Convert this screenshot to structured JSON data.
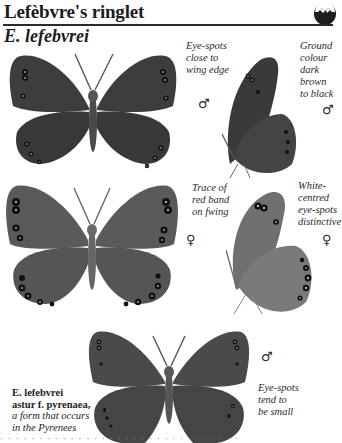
{
  "header": {
    "title": "Lefèbvre's ringlet",
    "icon": "habitat-mountain-icon"
  },
  "species": {
    "name": "E. lefebvrei"
  },
  "figures": [
    {
      "id": "male-upperside",
      "view": "upperside",
      "sex": "♂",
      "ground_color": "#3d3d3d",
      "note": "Eye-spots\nclose to\nwing edge"
    },
    {
      "id": "male-underside",
      "view": "underside",
      "sex": "♂",
      "ground_color": "#404040",
      "note": "Ground\ncolour\ndark\nbrown\nto black"
    },
    {
      "id": "female-upperside",
      "view": "upperside",
      "sex": "♀",
      "ground_color": "#5a5a5a",
      "note": "Trace of\nred band\non fwing"
    },
    {
      "id": "female-underside",
      "view": "underside",
      "sex": "♀",
      "ground_color": "#6e6e6e",
      "note": "White-\ncentred\neye-spots\ndistinctive"
    },
    {
      "id": "form-male-upperside",
      "view": "upperside",
      "sex": "♂",
      "ground_color": "#4a4a4a",
      "note": "Eye-spots\ntend to\nbe small"
    }
  ],
  "form_caption": {
    "name_line1": "E. lefebvrei",
    "name_line2": "astur f. pyrenaea,",
    "desc_line1": "a form that occurs",
    "desc_line2": "in the Pyrenees"
  },
  "footer_clipped_text": "· · · · · · · · · · · · · · · · · · · · · · · · · · · · · · ·"
}
